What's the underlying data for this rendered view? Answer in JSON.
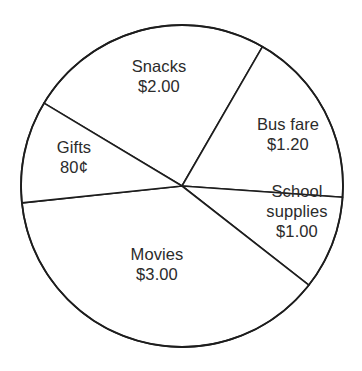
{
  "chart_data": {
    "type": "pie",
    "title": "",
    "subtitle": "",
    "xlabel": "",
    "ylabel": "",
    "legend": "none",
    "grid": false,
    "units": "dollars",
    "total": "$8.00",
    "categories": [
      "Snacks",
      "Bus fare",
      "School supplies",
      "Movies",
      "Gifts"
    ],
    "values": [
      2.0,
      1.2,
      1.0,
      3.0,
      0.8
    ],
    "value_labels": [
      "$2.00",
      "$1.20",
      "$1.00",
      "$3.00",
      "80¢"
    ],
    "slices": [
      {
        "name": "Snacks",
        "label": "Snacks",
        "value": 2.0,
        "value_label": "$2.00",
        "start_angle": 60,
        "end_angle": 149,
        "percent": 25.0
      },
      {
        "name": "Bus fare",
        "label": "Bus fare",
        "value": 1.2,
        "value_label": "$1.20",
        "start_angle": -4,
        "end_angle": 60,
        "percent": 15.0
      },
      {
        "name": "School supplies",
        "label_line1": "School",
        "label_line2": "supplies",
        "label": "School supplies",
        "value": 1.0,
        "value_label": "$1.00",
        "start_angle": -38,
        "end_angle": -4,
        "percent": 12.5
      },
      {
        "name": "Movies",
        "label": "Movies",
        "value": 3.0,
        "value_label": "$3.00",
        "start_angle": -174,
        "end_angle": -38,
        "percent": 37.5
      },
      {
        "name": "Gifts",
        "label": "Gifts",
        "value": 0.8,
        "value_label": "80¢",
        "start_angle": 149,
        "end_angle": 186,
        "percent": 10.0
      }
    ],
    "geometry": {
      "center_x": 182,
      "center_y": 186,
      "radius": 161
    },
    "colors": {
      "slice_fill": "#ffffff",
      "outline": "#1d1d1d",
      "text": "#2b2b2b",
      "background": "#ffffff"
    }
  }
}
